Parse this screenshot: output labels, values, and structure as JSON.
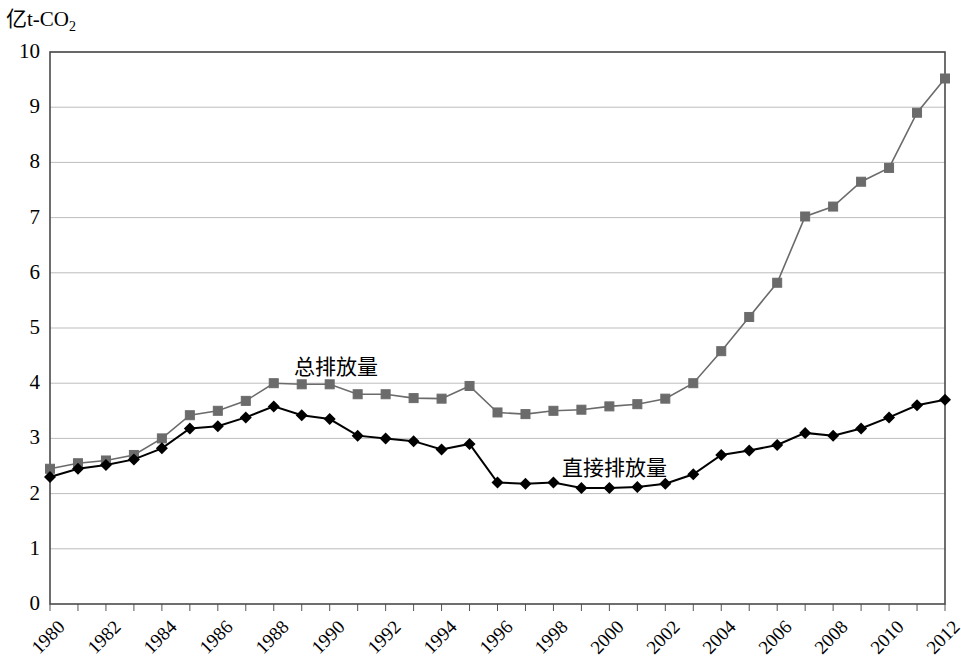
{
  "chart_data": {
    "type": "line",
    "title": "",
    "subtitle": "",
    "unit_label": "亿t-CO",
    "unit_label_sub": "2",
    "xlabel": "",
    "ylabel": "亿t-CO2",
    "ylim": [
      0,
      10
    ],
    "xlim": [
      1980,
      2012
    ],
    "ytick_step": 1,
    "xtick_step": 2,
    "grid": true,
    "legend_position": "inline-annotation",
    "yticks": [
      "10",
      "9",
      "8",
      "7",
      "6",
      "5",
      "4",
      "3",
      "2",
      "1",
      "0"
    ],
    "xticks": [
      "1980",
      "1982",
      "1984",
      "1986",
      "1988",
      "1990",
      "1992",
      "1994",
      "1996",
      "1998",
      "2000",
      "2002",
      "2004",
      "2006",
      "2008",
      "2010",
      "2012"
    ],
    "x": [
      1980,
      1981,
      1982,
      1983,
      1984,
      1985,
      1986,
      1987,
      1988,
      1989,
      1990,
      1991,
      1992,
      1993,
      1994,
      1995,
      1996,
      1997,
      1998,
      1999,
      2000,
      2001,
      2002,
      2003,
      2004,
      2005,
      2006,
      2007,
      2008,
      2009,
      2010,
      2011,
      2012
    ],
    "series": [
      {
        "name": "总排放量",
        "color": "#6b6b6b",
        "marker": "square",
        "annotation": "总排放量",
        "values": [
          2.45,
          2.55,
          2.6,
          2.7,
          3.0,
          3.42,
          3.5,
          3.68,
          4.0,
          3.98,
          3.98,
          3.8,
          3.8,
          3.73,
          3.72,
          3.95,
          3.47,
          3.44,
          3.5,
          3.52,
          3.58,
          3.62,
          3.72,
          4.0,
          4.58,
          5.2,
          5.82,
          7.02,
          7.2,
          7.65,
          7.9,
          8.9,
          9.52
        ]
      },
      {
        "name": "直接排放量",
        "color": "#000000",
        "marker": "diamond",
        "annotation": "直接排放量",
        "values": [
          2.3,
          2.45,
          2.52,
          2.62,
          2.82,
          3.18,
          3.22,
          3.38,
          3.58,
          3.42,
          3.35,
          3.05,
          3.0,
          2.95,
          2.8,
          2.9,
          2.2,
          2.18,
          2.2,
          2.1,
          2.1,
          2.12,
          2.18,
          2.35,
          2.7,
          2.78,
          2.88,
          3.1,
          3.05,
          3.18,
          3.38,
          3.6,
          3.7
        ]
      }
    ],
    "annotations": [
      {
        "text": "总排放量",
        "x": 1989,
        "y": 4.35
      },
      {
        "text": "直接排放量",
        "x": 1998.6,
        "y": 2.52
      }
    ]
  },
  "plot": {
    "left": 50,
    "top": 52,
    "right": 945,
    "bottom": 604,
    "axis_color": "#555555",
    "grid_color": "#bdbdbd",
    "frame_color": "#4a4a4a"
  }
}
